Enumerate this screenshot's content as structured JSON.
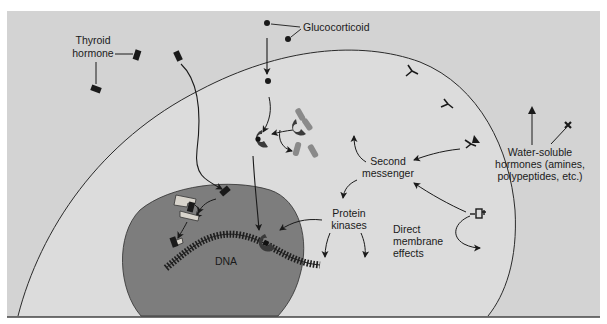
{
  "figure": {
    "colors": {
      "background_extracellular": "#d3d3d3",
      "cytoplasm": "#dcdcdc",
      "nucleus": "#7d7d7d",
      "receptor_dark": "#3a3a3a",
      "receptor_light": "#d8d4cc",
      "hsp_fragment": "#8a8a8a",
      "ink": "#1a1a1a"
    }
  },
  "labels": {
    "thyroid_hormone_line1": "Thyroid",
    "thyroid_hormone_line2": "hormone",
    "glucocorticoid": "Glucocorticoid",
    "water_soluble_line1": "Water-soluble",
    "water_soluble_line2": "hormones (amines,",
    "water_soluble_line3": "polypeptides, etc.)",
    "second_messenger_line1": "Second",
    "second_messenger_line2": "messenger",
    "protein_kinases_line1": "Protein",
    "protein_kinases_line2": "kinases",
    "direct_membrane_line1": "Direct",
    "direct_membrane_line2": "membrane",
    "direct_membrane_line3": "effects",
    "dna": "DNA"
  },
  "icons": {
    "thyroid_hormone": "dark-rectangle",
    "glucocorticoid": "dark-dot",
    "water_soluble_hormones": [
      "triangle",
      "cross-star"
    ],
    "membrane_receptor": "y-shaped-receptor",
    "cytoplasmic_receptor": "c-shaped-receptor",
    "nuclear_receptor": "l-shaped-receptor-on-dna"
  }
}
